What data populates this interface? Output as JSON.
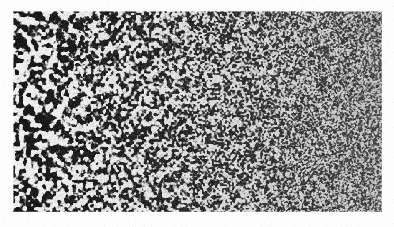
{
  "figure": {
    "domain": "Natural-Image",
    "kind": "scanned-grayscale-plate",
    "caption": "",
    "page_background": "#fdfdfd",
    "plate": {
      "x": 13,
      "y": 11,
      "width": 369,
      "height": 201,
      "ink_color": "#141414",
      "paper_color": "#f2f2f2",
      "border": "none",
      "description": "Labyrinthine Turing / reaction-diffusion stripe pattern with a monotonic left-to-right gradient in characteristic wavelength"
    },
    "grain": {
      "amount": 0.16,
      "paper_speckle": 0.05
    }
  },
  "pattern_data": {
    "type": "reaction-diffusion-labyrinth",
    "synthesis": "band-pass filtered noise thresholded to bilevel, wavelength swept along x",
    "seed": 20240517,
    "wavelength_px": {
      "left": 6.6,
      "right": 1.55,
      "falloff": "exponential",
      "sample_points": [
        {
          "x_frac": 0.0,
          "wavelength": 6.6
        },
        {
          "x_frac": 0.15,
          "wavelength": 5.3
        },
        {
          "x_frac": 0.3,
          "wavelength": 4.2
        },
        {
          "x_frac": 0.45,
          "wavelength": 3.4
        },
        {
          "x_frac": 0.6,
          "wavelength": 2.7
        },
        {
          "x_frac": 0.75,
          "wavelength": 2.2
        },
        {
          "x_frac": 0.9,
          "wavelength": 1.8
        },
        {
          "x_frac": 1.0,
          "wavelength": 1.55
        }
      ]
    },
    "orientation": "isotropic",
    "fill_fraction": 0.5,
    "contrast": {
      "left": 1.0,
      "right": 0.62,
      "note": "apparent contrast decreases to the right as stripe period approaches the scan sampling limit"
    },
    "blur_px": {
      "left": 0.35,
      "right": 0.0
    },
    "edge_softness_px": 1.0,
    "anti_alias_levels": 5,
    "octaves": 3
  },
  "labels": {
    "axes": [],
    "ticks": [],
    "legend": [],
    "annotations": []
  }
}
